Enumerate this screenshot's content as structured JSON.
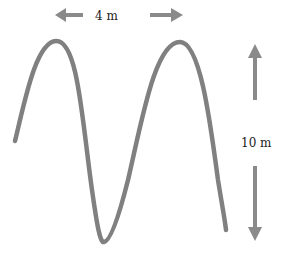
{
  "diagram": {
    "type": "transverse-wave",
    "wavelength_label": "4 m",
    "amplitude_label": "10 m",
    "colors": {
      "wave": "#808080",
      "arrow": "#8a8a8a",
      "text": "#222222",
      "background": "#ffffff"
    },
    "wave_points": [
      {
        "x": 15,
        "y": 141,
        "role": "start"
      },
      {
        "x": 56,
        "y": 41,
        "role": "crest"
      },
      {
        "x": 104,
        "y": 242,
        "role": "trough"
      },
      {
        "x": 180,
        "y": 42,
        "role": "crest"
      },
      {
        "x": 226,
        "y": 230,
        "role": "end"
      }
    ],
    "arrows": [
      {
        "name": "wavelength-left-arrow",
        "direction": "left"
      },
      {
        "name": "wavelength-right-arrow",
        "direction": "right"
      },
      {
        "name": "amplitude-up-arrow",
        "direction": "up"
      },
      {
        "name": "amplitude-down-arrow",
        "direction": "down"
      }
    ]
  }
}
